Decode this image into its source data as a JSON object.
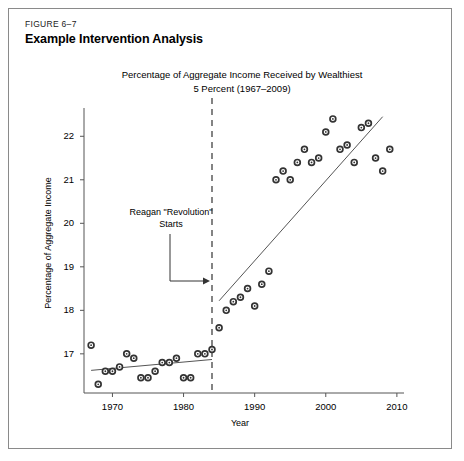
{
  "figure": {
    "number": "FIGURE 6–7",
    "title": "Example Intervention Analysis"
  },
  "chart_data": {
    "type": "scatter",
    "title": "Percentage of Aggregate Income Received by Wealthiest 5 Percent (1967–2009)",
    "title_line1": "Percentage of Aggregate Income Received by Wealthiest",
    "title_line2": "5 Percent (1967–2009)",
    "xlabel": "Year",
    "ylabel": "Percentage of Aggregate Income",
    "xlim": [
      1966,
      2011
    ],
    "ylim": [
      16.1,
      22.65
    ],
    "xticks": [
      1970,
      1980,
      1990,
      2000,
      2010
    ],
    "xtick_labels": [
      "1970",
      "1980",
      "1990",
      "2000",
      "2010"
    ],
    "yticks": [
      17,
      18,
      19,
      20,
      21,
      22
    ],
    "ytick_labels": [
      "17",
      "18",
      "19",
      "20",
      "21",
      "22"
    ],
    "grid": false,
    "legend": null,
    "x": [
      1967,
      1968,
      1969,
      1970,
      1971,
      1972,
      1973,
      1974,
      1975,
      1976,
      1977,
      1978,
      1979,
      1980,
      1981,
      1982,
      1983,
      1984,
      1985,
      1986,
      1987,
      1988,
      1989,
      1990,
      1991,
      1992,
      1993,
      1994,
      1995,
      1996,
      1997,
      1998,
      1999,
      2000,
      2001,
      2002,
      2003,
      2004,
      2005,
      2006,
      2007,
      2008,
      2009
    ],
    "y": [
      17.2,
      16.3,
      16.6,
      16.6,
      16.7,
      17.0,
      16.9,
      16.45,
      16.45,
      16.6,
      16.8,
      16.8,
      16.9,
      16.45,
      16.45,
      17.0,
      17.0,
      17.1,
      17.6,
      18.0,
      18.2,
      18.3,
      18.5,
      18.1,
      18.6,
      18.9,
      21.0,
      21.2,
      21.0,
      21.4,
      21.7,
      21.4,
      21.5,
      22.1,
      22.4,
      21.7,
      21.8,
      21.4,
      22.2,
      22.3,
      21.5,
      21.2,
      21.7
    ],
    "intervention": {
      "year": 1984,
      "line_style": "dashed",
      "label": "Reagan \"Revolution\" Starts",
      "label_line1": "Reagan \"Revolution\"",
      "label_line2": "Starts"
    },
    "trend_segments": [
      {
        "name": "pre-intervention",
        "x_start": 1967,
        "x_end": 1984,
        "y_start": 16.62,
        "y_end": 16.87
      },
      {
        "name": "post-intervention",
        "x_start": 1985,
        "x_end": 2008,
        "y_start": 18.22,
        "y_end": 22.45
      }
    ],
    "marker": {
      "shape": "circle-dot",
      "color": "#333333",
      "size": 5
    }
  }
}
